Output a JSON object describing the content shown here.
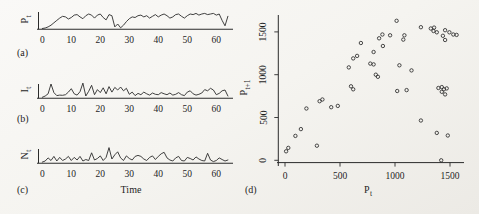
{
  "figure": {
    "bg": "#f5f4f0",
    "ink": "#2b2b2b"
  },
  "panels": {
    "a": {
      "tag": "(a)",
      "ylabel_base": "P",
      "ylabel_sub": "t"
    },
    "b": {
      "tag": "(b)",
      "ylabel_base": "I",
      "ylabel_sub": "t"
    },
    "c": {
      "tag": "(c)",
      "ylabel_base": "N",
      "ylabel_sub": "t",
      "xlabel": "Time"
    },
    "d": {
      "tag": "(d)",
      "ylabel_base": "P",
      "ylabel_sub": "t+1",
      "xlabel_base": "P",
      "xlabel_sub": "t"
    }
  },
  "chart_data": [
    {
      "id": "a",
      "type": "line",
      "title": "",
      "xlabel": "",
      "ylabel": "P_t",
      "xticks": [
        0,
        10,
        20,
        30,
        40,
        50,
        60
      ],
      "xlim": [
        0,
        66
      ],
      "ylim": [
        0,
        1400
      ],
      "grid": false,
      "x": [
        0,
        1,
        2,
        3,
        4,
        5,
        6,
        7,
        8,
        9,
        10,
        11,
        12,
        13,
        14,
        15,
        16,
        17,
        18,
        19,
        20,
        21,
        22,
        23,
        24,
        25,
        26,
        27,
        28,
        29,
        30,
        31,
        32,
        33,
        34,
        35,
        36,
        37,
        38,
        39,
        40,
        41,
        42,
        43,
        44,
        45,
        46,
        47,
        48,
        49,
        50,
        51,
        52,
        53,
        54,
        55,
        56,
        57,
        58,
        59,
        60,
        61,
        62,
        63,
        64
      ],
      "y": [
        20,
        60,
        150,
        300,
        500,
        700,
        900,
        1050,
        1000,
        820,
        950,
        1150,
        1200,
        1000,
        850,
        1100,
        1250,
        1150,
        900,
        1150,
        1250,
        950,
        750,
        1200,
        1100,
        150,
        400,
        80,
        300,
        600,
        850,
        1000,
        950,
        1100,
        1150,
        1000,
        1100,
        900,
        1050,
        1200,
        1000,
        1150,
        1250,
        1100,
        900,
        1000,
        1200,
        1250,
        1050,
        900,
        1100,
        1250,
        1200,
        1300,
        1150,
        1250,
        1300,
        1200,
        1250,
        1300,
        1150,
        1250,
        700,
        250,
        1050
      ]
    },
    {
      "id": "b",
      "type": "line",
      "title": "",
      "xlabel": "",
      "ylabel": "I_t",
      "xticks": [
        0,
        10,
        20,
        30,
        40,
        50,
        60
      ],
      "xlim": [
        0,
        66
      ],
      "ylim": [
        0,
        350
      ],
      "grid": false,
      "x": [
        0,
        1,
        2,
        3,
        4,
        5,
        6,
        7,
        8,
        9,
        10,
        11,
        12,
        13,
        14,
        15,
        16,
        17,
        18,
        19,
        20,
        21,
        22,
        23,
        24,
        25,
        26,
        27,
        28,
        29,
        30,
        31,
        32,
        33,
        34,
        35,
        36,
        37,
        38,
        39,
        40,
        41,
        42,
        43,
        44,
        45,
        46,
        47,
        48,
        49,
        50,
        51,
        52,
        53,
        54,
        55,
        56,
        57,
        58,
        59,
        60,
        61,
        62,
        63,
        64
      ],
      "y": [
        10,
        40,
        90,
        320,
        120,
        50,
        60,
        55,
        70,
        130,
        210,
        90,
        60,
        140,
        340,
        40,
        150,
        290,
        70,
        190,
        120,
        230,
        90,
        260,
        130,
        240,
        180,
        250,
        160,
        220,
        80,
        130,
        50,
        100,
        70,
        130,
        90,
        60,
        110,
        80,
        70,
        120,
        90,
        70,
        110,
        60,
        80,
        120,
        70,
        50,
        130,
        160,
        90,
        60,
        80,
        110,
        190,
        160,
        220,
        180,
        70,
        100,
        160,
        180,
        40
      ]
    },
    {
      "id": "c",
      "type": "line",
      "title": "",
      "xlabel": "Time",
      "ylabel": "N_t",
      "xticks": [
        0,
        10,
        20,
        30,
        40,
        50,
        60
      ],
      "xlim": [
        0,
        66
      ],
      "ylim": [
        0,
        150
      ],
      "grid": false,
      "x": [
        0,
        1,
        2,
        3,
        4,
        5,
        6,
        7,
        8,
        9,
        10,
        11,
        12,
        13,
        14,
        15,
        16,
        17,
        18,
        19,
        20,
        21,
        22,
        23,
        24,
        25,
        26,
        27,
        28,
        29,
        30,
        31,
        32,
        33,
        34,
        35,
        36,
        37,
        38,
        39,
        40,
        41,
        42,
        43,
        44,
        45,
        46,
        47,
        48,
        49,
        50,
        51,
        52,
        53,
        54,
        55,
        56,
        57,
        58,
        59,
        60,
        61,
        62,
        63,
        64
      ],
      "y": [
        5,
        15,
        45,
        20,
        60,
        15,
        50,
        20,
        35,
        60,
        20,
        50,
        25,
        60,
        15,
        30,
        20,
        95,
        25,
        40,
        65,
        20,
        50,
        145,
        35,
        75,
        105,
        45,
        20,
        65,
        40,
        25,
        60,
        70,
        60,
        35,
        20,
        50,
        65,
        30,
        60,
        85,
        100,
        45,
        25,
        15,
        45,
        60,
        20,
        15,
        50,
        40,
        25,
        55,
        35,
        20,
        15,
        90,
        25,
        10,
        20,
        45,
        30,
        15,
        25
      ]
    },
    {
      "id": "d",
      "type": "scatter",
      "title": "",
      "xlabel": "P_t",
      "ylabel": "P_t+1",
      "xticks": [
        0,
        500,
        1000,
        1500
      ],
      "yticks": [
        0,
        500,
        1000,
        1500
      ],
      "xlim": [
        0,
        1700
      ],
      "ylim": [
        0,
        1700
      ],
      "grid": false,
      "points": [
        [
          10,
          105
        ],
        [
          30,
          145
        ],
        [
          95,
          285
        ],
        [
          145,
          365
        ],
        [
          195,
          605
        ],
        [
          290,
          170
        ],
        [
          315,
          690
        ],
        [
          340,
          710
        ],
        [
          420,
          620
        ],
        [
          480,
          635
        ],
        [
          580,
          1085
        ],
        [
          600,
          865
        ],
        [
          620,
          830
        ],
        [
          620,
          1190
        ],
        [
          655,
          1220
        ],
        [
          690,
          1370
        ],
        [
          775,
          1130
        ],
        [
          805,
          1120
        ],
        [
          805,
          1265
        ],
        [
          825,
          1000
        ],
        [
          845,
          975
        ],
        [
          855,
          1425
        ],
        [
          885,
          1470
        ],
        [
          890,
          1335
        ],
        [
          955,
          1460
        ],
        [
          1015,
          1630
        ],
        [
          1020,
          810
        ],
        [
          1040,
          1110
        ],
        [
          1075,
          1410
        ],
        [
          1085,
          1460
        ],
        [
          1105,
          820
        ],
        [
          1150,
          1050
        ],
        [
          1235,
          1555
        ],
        [
          1235,
          465
        ],
        [
          1325,
          1540
        ],
        [
          1350,
          1510
        ],
        [
          1355,
          1550
        ],
        [
          1380,
          1495
        ],
        [
          1435,
          1455
        ],
        [
          1455,
          1520
        ],
        [
          1495,
          1495
        ],
        [
          1530,
          1470
        ],
        [
          1455,
          1405
        ],
        [
          1560,
          1465
        ],
        [
          1395,
          845
        ],
        [
          1425,
          855
        ],
        [
          1425,
          800
        ],
        [
          1445,
          830
        ],
        [
          1470,
          840
        ],
        [
          1455,
          770
        ],
        [
          1380,
          320
        ],
        [
          1480,
          290
        ],
        [
          1420,
          0
        ]
      ]
    }
  ]
}
